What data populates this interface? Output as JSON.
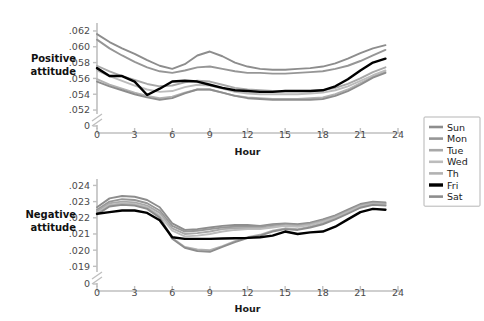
{
  "figure": {
    "width": 484,
    "height": 321,
    "background": "#ffffff"
  },
  "legend": {
    "position": "right",
    "items": [
      {
        "label": "Sun",
        "color": "#8d8d8d"
      },
      {
        "label": "Mon",
        "color": "#969696"
      },
      {
        "label": "Tue",
        "color": "#a8a8a8"
      },
      {
        "label": "Wed",
        "color": "#bcbcbc"
      },
      {
        "label": "Th",
        "color": "#b2b2b2"
      },
      {
        "label": "Fri",
        "color": "#000000"
      },
      {
        "label": "Sat",
        "color": "#8d8d8d"
      }
    ]
  },
  "chart_data": [
    {
      "type": "line",
      "title": "",
      "panel": "top",
      "ylabel": "Positive attitude",
      "xlabel": "Hour",
      "xlim": [
        0,
        24
      ],
      "xticks": [
        0,
        3,
        6,
        9,
        12,
        15,
        18,
        21,
        24
      ],
      "xticklabels": [
        "0",
        "3",
        "6",
        "9",
        "12",
        "15",
        "18",
        "21",
        "24"
      ],
      "ylim": [
        0.0515,
        0.0625
      ],
      "yticks": [
        0.052,
        0.054,
        0.056,
        0.058,
        0.06,
        0.062
      ],
      "yticklabels": [
        ".052",
        ".054",
        ".056",
        ".058",
        ".060",
        ".062"
      ],
      "axis_break": true,
      "zero_label": "0",
      "grid": false,
      "x": [
        0,
        1,
        2,
        3,
        4,
        5,
        6,
        7,
        8,
        9,
        10,
        11,
        12,
        13,
        14,
        15,
        16,
        17,
        18,
        19,
        20,
        21,
        22,
        23
      ],
      "series": [
        {
          "name": "Sun",
          "color": "#8d8d8d",
          "values": [
            0.0616,
            0.0606,
            0.0598,
            0.0591,
            0.0583,
            0.0576,
            0.0572,
            0.0578,
            0.0589,
            0.0594,
            0.0588,
            0.058,
            0.0575,
            0.0572,
            0.0571,
            0.0571,
            0.0572,
            0.0573,
            0.0575,
            0.0579,
            0.0585,
            0.0592,
            0.0598,
            0.0602
          ]
        },
        {
          "name": "Mon",
          "color": "#969696",
          "values": [
            0.0609,
            0.0598,
            0.0589,
            0.0581,
            0.0574,
            0.0569,
            0.0567,
            0.057,
            0.0574,
            0.0575,
            0.0572,
            0.0569,
            0.0567,
            0.0567,
            0.0566,
            0.0566,
            0.0567,
            0.0568,
            0.0569,
            0.0572,
            0.0576,
            0.0582,
            0.0589,
            0.0596
          ]
        },
        {
          "name": "Tue",
          "color": "#a8a8a8",
          "values": [
            0.0576,
            0.0569,
            0.0563,
            0.0558,
            0.0553,
            0.055,
            0.0551,
            0.0555,
            0.0557,
            0.0556,
            0.0552,
            0.0548,
            0.0546,
            0.0545,
            0.0544,
            0.0544,
            0.0544,
            0.0544,
            0.0545,
            0.0548,
            0.0553,
            0.056,
            0.0568,
            0.0574
          ]
        },
        {
          "name": "Wed",
          "color": "#bcbcbc",
          "values": [
            0.057,
            0.0563,
            0.0557,
            0.0551,
            0.0546,
            0.0543,
            0.0544,
            0.0549,
            0.0552,
            0.0551,
            0.0547,
            0.0543,
            0.0541,
            0.054,
            0.054,
            0.054,
            0.054,
            0.0541,
            0.0542,
            0.0545,
            0.055,
            0.0557,
            0.0564,
            0.057
          ]
        },
        {
          "name": "Th",
          "color": "#b2b2b2",
          "values": [
            0.0559,
            0.0552,
            0.0547,
            0.0542,
            0.0538,
            0.0535,
            0.0537,
            0.0542,
            0.0546,
            0.0546,
            0.0542,
            0.0538,
            0.0536,
            0.0535,
            0.0534,
            0.0534,
            0.0534,
            0.0535,
            0.0536,
            0.054,
            0.0546,
            0.0554,
            0.0562,
            0.0568
          ]
        },
        {
          "name": "Fri",
          "color": "#000000",
          "values": [
            0.0573,
            0.0563,
            0.0563,
            0.0556,
            0.0539,
            0.0547,
            0.0556,
            0.0557,
            0.0556,
            0.0552,
            0.0548,
            0.0545,
            0.0544,
            0.0543,
            0.0543,
            0.0544,
            0.0544,
            0.0544,
            0.0545,
            0.055,
            0.0559,
            0.057,
            0.058,
            0.0585
          ]
        },
        {
          "name": "Sat",
          "color": "#8d8d8d",
          "values": [
            0.0556,
            0.055,
            0.0545,
            0.054,
            0.0536,
            0.0533,
            0.0535,
            0.0541,
            0.0546,
            0.0546,
            0.0542,
            0.0538,
            0.0535,
            0.0534,
            0.0533,
            0.0533,
            0.0533,
            0.0533,
            0.0534,
            0.0538,
            0.0544,
            0.0552,
            0.0561,
            0.0567
          ]
        }
      ]
    },
    {
      "type": "line",
      "title": "",
      "panel": "bottom",
      "ylabel": "Negative attitude",
      "xlabel": "Hour",
      "xlim": [
        0,
        24
      ],
      "xticks": [
        0,
        3,
        6,
        9,
        12,
        15,
        18,
        21,
        24
      ],
      "xticklabels": [
        "0",
        "3",
        "6",
        "9",
        "12",
        "15",
        "18",
        "21",
        "24"
      ],
      "ylim": [
        0.01865,
        0.02415
      ],
      "yticks": [
        0.019,
        0.02,
        0.021,
        0.022,
        0.023,
        0.024
      ],
      "yticklabels": [
        ".019",
        ".020",
        ".021",
        ".022",
        ".023",
        ".024"
      ],
      "axis_break": true,
      "zero_label": "0",
      "grid": false,
      "x": [
        0,
        1,
        2,
        3,
        4,
        5,
        6,
        7,
        8,
        9,
        10,
        11,
        12,
        13,
        14,
        15,
        16,
        17,
        18,
        19,
        20,
        21,
        22,
        23
      ],
      "series": [
        {
          "name": "Sun",
          "color": "#8d8d8d",
          "values": [
            0.02265,
            0.0232,
            0.02335,
            0.0233,
            0.0231,
            0.02265,
            0.02165,
            0.02125,
            0.0213,
            0.0214,
            0.0215,
            0.02155,
            0.02155,
            0.0215,
            0.0216,
            0.02165,
            0.0216,
            0.0217,
            0.0219,
            0.02215,
            0.0225,
            0.02285,
            0.023,
            0.02295
          ]
        },
        {
          "name": "Mon",
          "color": "#969696",
          "values": [
            0.0225,
            0.023,
            0.02315,
            0.0231,
            0.0229,
            0.02245,
            0.0215,
            0.02115,
            0.0212,
            0.0213,
            0.0214,
            0.02145,
            0.02145,
            0.02145,
            0.02155,
            0.0216,
            0.02155,
            0.02165,
            0.02185,
            0.0221,
            0.02245,
            0.0228,
            0.02295,
            0.0229
          ]
        },
        {
          "name": "Tue",
          "color": "#a8a8a8",
          "values": [
            0.0224,
            0.0229,
            0.023,
            0.02295,
            0.02275,
            0.0223,
            0.02135,
            0.021,
            0.02105,
            0.02115,
            0.0213,
            0.02135,
            0.02135,
            0.02135,
            0.02145,
            0.02155,
            0.0215,
            0.0216,
            0.0218,
            0.02205,
            0.0224,
            0.02275,
            0.0229,
            0.02285
          ]
        },
        {
          "name": "Wed",
          "color": "#bcbcbc",
          "values": [
            0.0223,
            0.0228,
            0.0229,
            0.02285,
            0.02265,
            0.02215,
            0.0212,
            0.02085,
            0.0209,
            0.021,
            0.02115,
            0.02125,
            0.0213,
            0.0213,
            0.0214,
            0.0215,
            0.02145,
            0.02155,
            0.02175,
            0.022,
            0.02235,
            0.0227,
            0.02285,
            0.0228
          ]
        },
        {
          "name": "Th",
          "color": "#b2b2b2",
          "values": [
            0.02225,
            0.02275,
            0.02285,
            0.0228,
            0.0226,
            0.02205,
            0.02075,
            0.0202,
            0.02005,
            0.02,
            0.02025,
            0.02055,
            0.0208,
            0.02095,
            0.0212,
            0.02135,
            0.0213,
            0.02145,
            0.02165,
            0.02195,
            0.0223,
            0.02265,
            0.02285,
            0.0228
          ]
        },
        {
          "name": "Fri",
          "color": "#000000",
          "values": [
            0.02225,
            0.02235,
            0.02245,
            0.02245,
            0.0223,
            0.02185,
            0.0208,
            0.0207,
            0.0207,
            0.0207,
            0.02072,
            0.02074,
            0.02076,
            0.0208,
            0.0209,
            0.02115,
            0.021,
            0.0211,
            0.02115,
            0.02145,
            0.0219,
            0.02235,
            0.02255,
            0.0225
          ]
        },
        {
          "name": "Sat",
          "color": "#8d8d8d",
          "values": [
            0.0222,
            0.0227,
            0.0228,
            0.02275,
            0.02255,
            0.022,
            0.0207,
            0.02015,
            0.01995,
            0.0199,
            0.0202,
            0.0205,
            0.02075,
            0.0209,
            0.02115,
            0.0213,
            0.02125,
            0.0214,
            0.0216,
            0.0219,
            0.02225,
            0.02262,
            0.0228,
            0.02275
          ]
        }
      ]
    }
  ]
}
